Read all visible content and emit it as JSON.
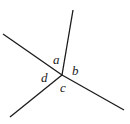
{
  "diagram": {
    "type": "intersecting-lines-angles",
    "line_color": "#1a1a1a",
    "vertex": {
      "x": 62,
      "y": 75
    },
    "rays": [
      {
        "name": "ray-up",
        "x2": 73,
        "y2": 10
      },
      {
        "name": "ray-left-up",
        "x2": 3,
        "y2": 34
      },
      {
        "name": "ray-right-down",
        "x2": 124,
        "y2": 110
      },
      {
        "name": "ray-left-down",
        "x2": 10,
        "y2": 117
      }
    ],
    "angle_labels": [
      {
        "text": "a",
        "x": 53,
        "y": 64
      },
      {
        "text": "b",
        "x": 72,
        "y": 75
      },
      {
        "text": "c",
        "x": 60,
        "y": 92
      },
      {
        "text": "d",
        "x": 41,
        "y": 82
      }
    ]
  }
}
